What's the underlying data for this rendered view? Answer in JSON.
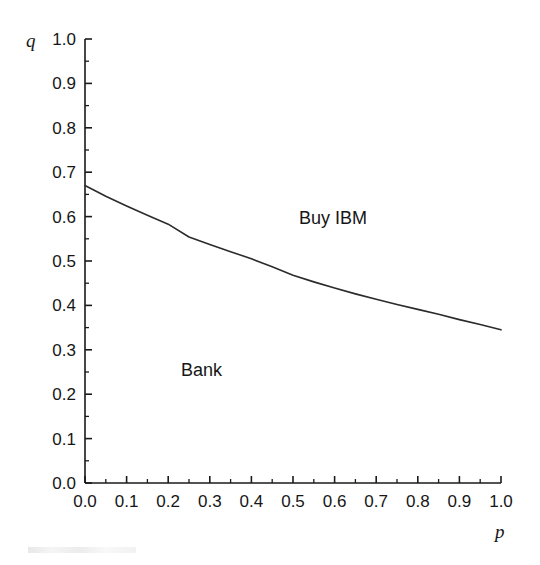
{
  "figure": {
    "background_color": "#ffffff",
    "line_color": "#2b2b2b",
    "axis_color": "#1a1a1a"
  },
  "axes": {
    "x_title": "p",
    "y_title": "q",
    "x_tick_labels": [
      "0.0",
      "0.1",
      "0.2",
      "0.3",
      "0.4",
      "0.5",
      "0.6",
      "0.7",
      "0.8",
      "0.9",
      "1.0"
    ],
    "y_tick_labels": [
      "0.0",
      "0.1",
      "0.2",
      "0.3",
      "0.4",
      "0.5",
      "0.6",
      "0.7",
      "0.8",
      "0.9",
      "1.0"
    ]
  },
  "regions": {
    "upper_label": "Buy IBM",
    "lower_label": "Bank"
  },
  "chart_data": {
    "type": "line",
    "title": "",
    "subtitle": "",
    "xlabel": "p",
    "ylabel": "q",
    "xlim": [
      0.0,
      1.0
    ],
    "ylim": [
      0.0,
      1.0
    ],
    "grid": false,
    "legend": "none",
    "x_major_ticks": [
      0.0,
      0.1,
      0.2,
      0.3,
      0.4,
      0.5,
      0.6,
      0.7,
      0.8,
      0.9,
      1.0
    ],
    "y_major_ticks": [
      0.0,
      0.1,
      0.2,
      0.3,
      0.4,
      0.5,
      0.6,
      0.7,
      0.8,
      0.9,
      1.0
    ],
    "x_minor_tick_step": 0.05,
    "y_minor_tick_step": 0.05,
    "series": [
      {
        "name": "indifference boundary",
        "x": [
          0.0,
          0.05,
          0.1,
          0.15,
          0.2,
          0.25,
          0.3,
          0.35,
          0.4,
          0.45,
          0.5,
          0.55,
          0.6,
          0.65,
          0.7,
          0.75,
          0.8,
          0.85,
          0.9,
          0.95,
          1.0
        ],
        "y": [
          0.67,
          0.646,
          0.624,
          0.603,
          0.583,
          0.554,
          0.537,
          0.521,
          0.505,
          0.487,
          0.468,
          0.453,
          0.439,
          0.426,
          0.414,
          0.402,
          0.391,
          0.38,
          0.368,
          0.357,
          0.345
        ]
      }
    ],
    "annotations": [
      {
        "text": "Buy IBM",
        "x": 0.52,
        "y": 0.6,
        "region": "above-curve"
      },
      {
        "text": "Bank",
        "x": 0.25,
        "y": 0.255,
        "region": "below-curve"
      }
    ]
  }
}
